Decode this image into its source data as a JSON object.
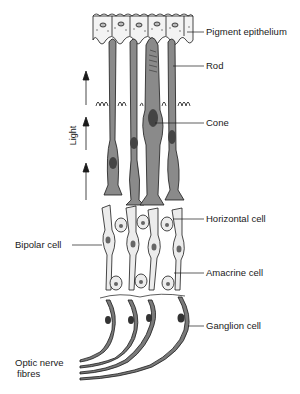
{
  "diagram": {
    "type": "anatomical illustration",
    "labels": {
      "pigment_epithelium": "Pigment epithelium",
      "rod": "Rod",
      "cone": "Cone",
      "horizontal_cell": "Horizontal cell",
      "bipolar_cell": "Bipolar cell",
      "amacrine_cell": "Amacrine cell",
      "ganglion_cell": "Ganglion cell",
      "optic_nerve_line1": "Optic nerve",
      "optic_nerve_line2": "fibres",
      "light": "Light"
    },
    "arrow_direction": "up",
    "arrow_count": 3,
    "caption": "",
    "colors": {
      "cell_fill_dark": "#8a8a8a",
      "cell_fill_light": "#e9e9e9",
      "ganglion_fill": "#7a7a7a",
      "outline": "#1a1a1a",
      "background": "#ffffff"
    }
  }
}
